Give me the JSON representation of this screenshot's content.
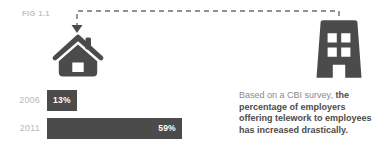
{
  "figure": {
    "label": "FIG 1.1",
    "icons": {
      "home": "house-icon",
      "office": "office-building-icon",
      "connector": "dashed-arrow-connector"
    },
    "colors": {
      "dark": "#4b4b4b",
      "muted_label": "#b9b9b9",
      "fig_label": "#c2c2c2",
      "body_text": "#8a8a8a",
      "emphasis_text": "#4b4b4b",
      "background": "#ffffff"
    }
  },
  "chart_data": {
    "type": "bar",
    "orientation": "horizontal",
    "title": "FIG 1.1",
    "xlabel": "",
    "ylabel": "",
    "categories": [
      "2006",
      "2011"
    ],
    "values": [
      13,
      59
    ],
    "value_labels": [
      "13%",
      "59%"
    ],
    "xlim": [
      0,
      77
    ],
    "grid": false,
    "legend": "none",
    "series": [
      {
        "name": "Employers offering telework",
        "values": [
          13,
          59
        ]
      }
    ]
  },
  "caption": {
    "lead": "Based on a CBI survey, ",
    "emphasis": "the percentage of employers offering telework to employees has increased drastically."
  }
}
